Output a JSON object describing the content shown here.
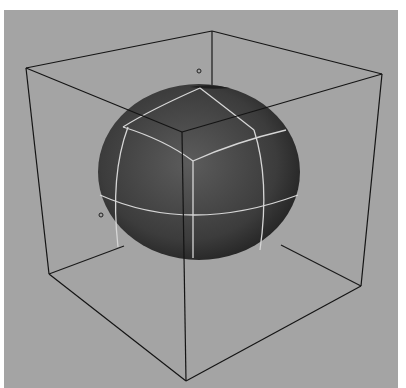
{
  "scene": {
    "description": "Grayscale 3D viewport render: shaded sphere with isoparm lines inside a wireframe bounding cube",
    "background_color": "#a4a4a4",
    "page_color": "#ffffff",
    "sphere": {
      "center": [
        199,
        172
      ],
      "rx": 101,
      "ry": 87,
      "fill_dark": "#2e2e2e",
      "fill_light": "#6a6a6a",
      "isoparm_color": "#d8d8d8"
    },
    "cube": {
      "edge_color": "#1a1a1a"
    },
    "markers": [
      {
        "name": "pivot-marker-top",
        "pos": [
          199,
          71
        ]
      },
      {
        "name": "pivot-marker-left",
        "pos": [
          101,
          215
        ]
      }
    ]
  }
}
